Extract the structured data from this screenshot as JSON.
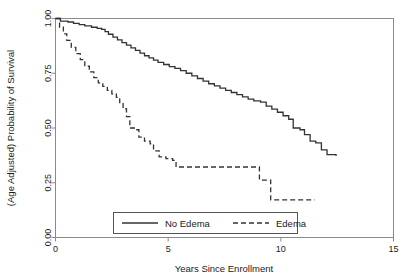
{
  "chart_data": {
    "type": "line",
    "title": "",
    "subtitle": "",
    "xlabel": "Years Since Enrollment",
    "ylabel": "(Age Adjusted) Probability of Survival",
    "xlim": [
      0,
      15
    ],
    "ylim": [
      0,
      1
    ],
    "xticks": [
      0,
      5,
      10,
      15
    ],
    "xtick_labels": [
      "0",
      "5",
      "10",
      "15"
    ],
    "yticks": [
      0.0,
      0.25,
      0.5,
      0.75,
      1.0
    ],
    "ytick_labels": [
      "0.00",
      "0.25",
      "0.50",
      "0.75",
      "1.00"
    ],
    "grid": false,
    "legend_position": "bottom-center",
    "curve_style": "step",
    "series": [
      {
        "name": "No Edema",
        "line_style": "solid",
        "color": "#333333",
        "points": [
          [
            0.0,
            1.0
          ],
          [
            0.12,
            1.0
          ],
          [
            0.22,
            0.988
          ],
          [
            0.4,
            0.988
          ],
          [
            0.55,
            0.984
          ],
          [
            0.8,
            0.978
          ],
          [
            1.05,
            0.972
          ],
          [
            1.3,
            0.966
          ],
          [
            1.6,
            0.96
          ],
          [
            1.85,
            0.955
          ],
          [
            2.05,
            0.95
          ],
          [
            2.2,
            0.94
          ],
          [
            2.35,
            0.928
          ],
          [
            2.55,
            0.915
          ],
          [
            2.75,
            0.902
          ],
          [
            2.95,
            0.89
          ],
          [
            3.15,
            0.878
          ],
          [
            3.35,
            0.866
          ],
          [
            3.55,
            0.854
          ],
          [
            3.75,
            0.842
          ],
          [
            3.95,
            0.83
          ],
          [
            4.15,
            0.82
          ],
          [
            4.35,
            0.81
          ],
          [
            4.55,
            0.8
          ],
          [
            4.8,
            0.79
          ],
          [
            5.05,
            0.78
          ],
          [
            5.3,
            0.772
          ],
          [
            5.55,
            0.762
          ],
          [
            5.8,
            0.75
          ],
          [
            6.05,
            0.738
          ],
          [
            6.3,
            0.726
          ],
          [
            6.55,
            0.714
          ],
          [
            6.8,
            0.702
          ],
          [
            7.05,
            0.692
          ],
          [
            7.3,
            0.682
          ],
          [
            7.55,
            0.672
          ],
          [
            7.8,
            0.662
          ],
          [
            8.05,
            0.652
          ],
          [
            8.3,
            0.642
          ],
          [
            8.55,
            0.632
          ],
          [
            8.8,
            0.624
          ],
          [
            9.1,
            0.618
          ],
          [
            9.35,
            0.6
          ],
          [
            9.6,
            0.586
          ],
          [
            9.85,
            0.572
          ],
          [
            10.1,
            0.556
          ],
          [
            10.35,
            0.54
          ],
          [
            10.55,
            0.5
          ],
          [
            10.85,
            0.492
          ],
          [
            11.05,
            0.47
          ],
          [
            11.3,
            0.44
          ],
          [
            11.55,
            0.432
          ],
          [
            11.8,
            0.4
          ],
          [
            12.05,
            0.378
          ],
          [
            12.45,
            0.372
          ]
        ]
      },
      {
        "name": "Edema",
        "line_style": "dashed",
        "color": "#333333",
        "points": [
          [
            0.0,
            1.0
          ],
          [
            0.18,
            0.96
          ],
          [
            0.35,
            0.93
          ],
          [
            0.5,
            0.9
          ],
          [
            0.7,
            0.868
          ],
          [
            0.9,
            0.84
          ],
          [
            1.1,
            0.812
          ],
          [
            1.3,
            0.782
          ],
          [
            1.5,
            0.756
          ],
          [
            1.7,
            0.73
          ],
          [
            1.9,
            0.706
          ],
          [
            2.1,
            0.69
          ],
          [
            2.3,
            0.672
          ],
          [
            2.5,
            0.656
          ],
          [
            2.7,
            0.64
          ],
          [
            2.85,
            0.616
          ],
          [
            3.0,
            0.588
          ],
          [
            3.15,
            0.552
          ],
          [
            3.3,
            0.5
          ],
          [
            3.5,
            0.492
          ],
          [
            3.7,
            0.458
          ],
          [
            3.95,
            0.44
          ],
          [
            4.2,
            0.428
          ],
          [
            4.35,
            0.396
          ],
          [
            4.6,
            0.368
          ],
          [
            4.9,
            0.36
          ],
          [
            5.2,
            0.352
          ],
          [
            5.35,
            0.322
          ],
          [
            6.0,
            0.322
          ],
          [
            7.0,
            0.322
          ],
          [
            8.0,
            0.322
          ],
          [
            8.9,
            0.322
          ],
          [
            9.05,
            0.262
          ],
          [
            9.45,
            0.262
          ],
          [
            9.55,
            0.172
          ],
          [
            10.5,
            0.172
          ],
          [
            11.5,
            0.172
          ]
        ]
      }
    ]
  },
  "legend": {
    "entries": [
      {
        "label": "No Edema",
        "style": "solid"
      },
      {
        "label": "Edema",
        "style": "dashed"
      }
    ]
  }
}
